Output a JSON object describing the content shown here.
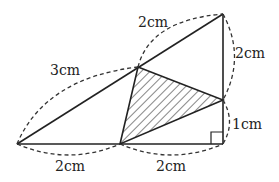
{
  "diagram": {
    "type": "geometry",
    "points": {
      "A": {
        "x": 17,
        "y": 144
      },
      "B": {
        "x": 120,
        "y": 144
      },
      "C": {
        "x": 223,
        "y": 144
      },
      "D": {
        "x": 223,
        "y": 100
      },
      "E": {
        "x": 223,
        "y": 14
      },
      "F": {
        "x": 138,
        "y": 67
      }
    },
    "shaded_triangle": [
      "F",
      "D",
      "B"
    ],
    "right_angle_at": "C",
    "labels": {
      "hyp_lower": "3cm",
      "hyp_upper": "2cm",
      "vert_upper": "2cm",
      "vert_lower": "1cm",
      "base_left": "2cm",
      "base_right": "2cm"
    },
    "colors": {
      "line": "#222222",
      "background": "#ffffff"
    }
  }
}
